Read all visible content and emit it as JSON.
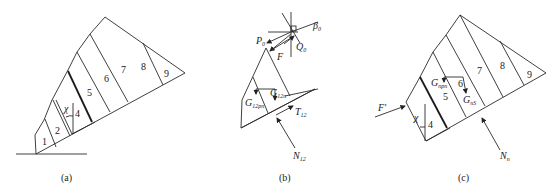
{
  "figure": {
    "panels": [
      {
        "id": "a",
        "caption": "(a)",
        "slice_labels": [
          "1",
          "2",
          "4",
          "5",
          "6",
          "7",
          "8",
          "9"
        ],
        "angle_label": "χ"
      },
      {
        "id": "b",
        "caption": "(b)",
        "force_labels": {
          "P": "P",
          "P_sub": "0",
          "Q": "Q",
          "Q_sub": "0",
          "F": "F",
          "beta": "β",
          "beta_sub": "0",
          "G1": "G",
          "G1_sub": "12n",
          "G2": "G",
          "G2_sub": "12pn",
          "T": "T",
          "T_sub": "12",
          "N": "N",
          "N_sub": "12"
        }
      },
      {
        "id": "c",
        "caption": "(c)",
        "slice_labels": [
          "4",
          "5",
          "6",
          "7",
          "8",
          "9"
        ],
        "angle_label": "χ",
        "force_labels": {
          "F": "F'",
          "G1": "G",
          "G1_sub": "npn",
          "G2": "G",
          "G2_sub": "nS",
          "N": "N",
          "N_sub": "n"
        }
      }
    ]
  }
}
